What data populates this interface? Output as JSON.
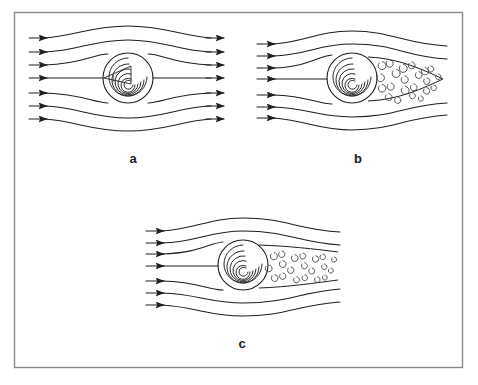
{
  "figure": {
    "title": "",
    "frame": {
      "x": 14,
      "y": 12,
      "width": 449,
      "height": 356,
      "border_color": "#8a8a8a",
      "background_color": "#ffffff"
    },
    "line_color": "#1f1f1f",
    "eddy_color": "#3a3a3a"
  },
  "panels": [
    {
      "id": "a",
      "label": "a",
      "label_x": 133,
      "label_y": 163,
      "regime": "laminar-symmetric-flow",
      "cylinder": {
        "cx": 128,
        "cy": 78,
        "r": 25
      },
      "inlet_arrow_count": 7,
      "outlet_arrow_count": 7,
      "has_outlet_arrows": true,
      "has_wake": false,
      "has_angle_marker": true,
      "eddy_count": 0
    },
    {
      "id": "b",
      "label": "b",
      "label_x": 358,
      "label_y": 163,
      "regime": "turbulent-wide-triangular-wake",
      "cylinder": {
        "cx": 352,
        "cy": 78,
        "r": 25
      },
      "inlet_arrow_count": 7,
      "outlet_arrow_count": 0,
      "has_outlet_arrows": false,
      "has_wake": true,
      "wake_shape": "triangular-expanding",
      "wake_tip_x": 443,
      "wake_half_height": 36,
      "has_angle_marker": false,
      "eddy_count": 22
    },
    {
      "id": "c",
      "label": "c",
      "label_x": 242,
      "label_y": 348,
      "regime": "turbulent-narrow-elongated-wake",
      "cylinder": {
        "cx": 243,
        "cy": 265,
        "r": 25
      },
      "inlet_arrow_count": 7,
      "outlet_arrow_count": 0,
      "has_outlet_arrows": false,
      "has_wake": true,
      "wake_shape": "narrow-elongated",
      "wake_tip_x": 340,
      "wake_half_height": 17,
      "has_angle_marker": false,
      "eddy_count": 20
    }
  ]
}
